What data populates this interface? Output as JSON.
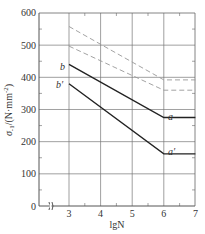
{
  "chart_data": {
    "type": "line",
    "title": "",
    "xlabel": "lgN",
    "ylabel": "σ-1/(N·mm⁻²)",
    "xlim": [
      2,
      7
    ],
    "ylim": [
      0,
      600
    ],
    "x_break": true,
    "x_ticks": [
      3,
      4,
      5,
      6,
      7
    ],
    "y_ticks": [
      0,
      100,
      200,
      300,
      400,
      500,
      600
    ],
    "grid": true,
    "legend": null,
    "series": [
      {
        "name": "upper-dashed",
        "style": "dashed",
        "x": [
          3,
          6,
          7
        ],
        "y": [
          558,
          392,
          392
        ]
      },
      {
        "name": "lower-dashed",
        "style": "dashed",
        "x": [
          3,
          6,
          7
        ],
        "y": [
          497,
          360,
          360
        ]
      },
      {
        "name": "b-a",
        "style": "solid",
        "label_start": "b",
        "label_end": "a",
        "x": [
          3,
          6,
          7
        ],
        "y": [
          440,
          275,
          275
        ]
      },
      {
        "name": "b'-a'",
        "style": "solid",
        "label_start": "b′",
        "label_end": "a′",
        "x": [
          3,
          6,
          7
        ],
        "y": [
          380,
          162,
          162
        ]
      }
    ]
  },
  "labels": {
    "xlabel": "lgN",
    "ylabel_main": "σ",
    "ylabel_sub": "-1",
    "ylabel_unit": "/(N·mm",
    "ylabel_exp": "-2",
    "ylabel_close": ")",
    "x_ticks": [
      "3",
      "4",
      "5",
      "6",
      "7"
    ],
    "y_ticks": [
      "0",
      "100",
      "200",
      "300",
      "400",
      "500",
      "600"
    ],
    "curve_b": "b",
    "curve_b_prime": "b′",
    "curve_a": "a",
    "curve_a_prime": "a′"
  },
  "colors": {
    "axis": "#555555",
    "grid": "#777777",
    "solid_line": "#222222",
    "dashed_line": "#999999"
  }
}
